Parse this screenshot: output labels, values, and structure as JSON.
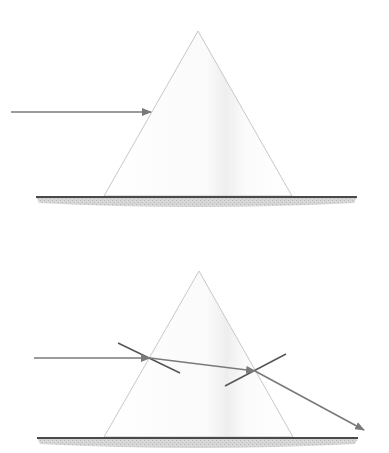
{
  "figure": {
    "description": "Light ray incident on a triangular prism (top) and refraction through the prism with normals (bottom)",
    "colors": {
      "background": "#ffffff",
      "prism_outline": "#c8c8c8",
      "prism_fill_shade": "#f1f1f1",
      "ray": "#7a7a7a",
      "normal": "#555555",
      "ground_line": "#4a4a4a",
      "ground_fill": "#cfcfcf"
    }
  },
  "diagrams": [
    {
      "id": "top",
      "label": "incident-ray-on-prism",
      "prism": {
        "apex": [
          198,
          31
        ],
        "base_left": [
          104,
          196
        ],
        "base_right": [
          292,
          196
        ]
      },
      "ground": {
        "x1": 36,
        "x2": 357,
        "y": 197
      },
      "rays": [
        {
          "name": "incident-ray",
          "from": [
            11,
            112
          ],
          "to": [
            151,
            112
          ],
          "arrow": true
        }
      ],
      "normals": []
    },
    {
      "id": "bottom",
      "label": "refraction-through-prism",
      "prism": {
        "apex": [
          199,
          271
        ],
        "base_left": [
          104,
          437
        ],
        "base_right": [
          293,
          437
        ]
      },
      "ground": {
        "x1": 37,
        "x2": 358,
        "y": 438
      },
      "rays": [
        {
          "name": "incident-ray",
          "from": [
            34,
            358
          ],
          "to": [
            150,
            358
          ],
          "arrow": true
        },
        {
          "name": "refracted-ray-inside",
          "from": [
            150,
            358
          ],
          "to": [
            255,
            371
          ],
          "arrow": true
        },
        {
          "name": "emergent-ray",
          "from": [
            255,
            371
          ],
          "to": [
            364,
            430
          ],
          "arrow": true
        }
      ],
      "normals": [
        {
          "name": "normal-entry",
          "from": [
            118,
            343
          ],
          "to": [
            180,
            373
          ]
        },
        {
          "name": "normal-exit",
          "from": [
            225,
            386
          ],
          "to": [
            286,
            354
          ]
        }
      ]
    }
  ]
}
